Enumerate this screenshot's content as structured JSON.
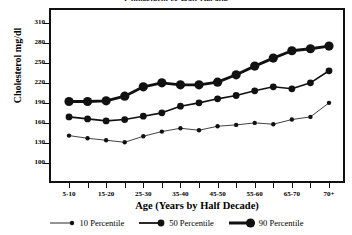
{
  "chart_data": {
    "type": "line",
    "title": "Cholesterol vs Half Decade",
    "xlabel": "Age (Years by Half Decade)",
    "ylabel": "Cholesterol mg/dl",
    "grid": false,
    "legend_position": "bottom",
    "ylim": [
      85,
      320
    ],
    "yticks": [
      100,
      130,
      160,
      190,
      220,
      250,
      280,
      310
    ],
    "categories": [
      "5-10",
      "10-15",
      "15-20",
      "20-25",
      "25-30",
      "30-35",
      "35-40",
      "40-45",
      "45-50",
      "50-55",
      "55-60",
      "60-65",
      "65-70",
      "70+",
      "70+ "
    ],
    "xtick_labels": [
      "5-10",
      "",
      "15-20",
      "",
      "25-30",
      "",
      "35-40",
      "",
      "45-50",
      "",
      "55-60",
      "",
      "65-70",
      "",
      "70+"
    ],
    "series": [
      {
        "name": "10 Percentile",
        "color": "#111111",
        "line_width": 0.8,
        "marker_size": 2.2,
        "values": [
          141,
          137,
          134,
          131,
          140,
          147,
          152,
          149,
          155,
          157,
          160,
          158,
          165,
          169,
          190
        ]
      },
      {
        "name": "50 Percentile",
        "color": "#111111",
        "line_width": 1.6,
        "marker_size": 3.4,
        "values": [
          169,
          166,
          163,
          165,
          170,
          175,
          185,
          190,
          196,
          201,
          208,
          214,
          211,
          220,
          238
        ]
      },
      {
        "name": "90 Percentile",
        "color": "#111111",
        "line_width": 2.8,
        "marker_size": 4.6,
        "values": [
          192,
          192,
          193,
          200,
          214,
          220,
          217,
          217,
          221,
          232,
          245,
          257,
          268,
          271,
          275
        ]
      }
    ]
  },
  "legend": {
    "items": [
      {
        "label": "10 Percentile"
      },
      {
        "label": "50 Percentile"
      },
      {
        "label": "90 Percentile"
      }
    ]
  },
  "colors": {
    "axis": "#111111",
    "ink": "#000000",
    "background": "#ffffff"
  }
}
